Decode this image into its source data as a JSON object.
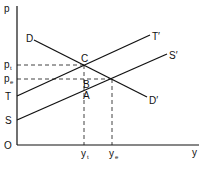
{
  "diagram": {
    "type": "supply-demand-with-tax",
    "axes": {
      "y_label": "p",
      "x_label": "y",
      "origin_label": "O"
    },
    "curves": [
      {
        "name": "demand",
        "start_label": "D",
        "end_label": "D′"
      },
      {
        "name": "supply",
        "start_label": "S",
        "end_label": "S′"
      },
      {
        "name": "tax-shifted-supply",
        "start_label": "T",
        "end_label": "T′"
      }
    ],
    "points": {
      "C": "C",
      "B": "B",
      "A": "A"
    },
    "price_labels": {
      "pt_main": "p",
      "pt_sub": "t",
      "pe_main": "p",
      "pe_sub": "e"
    },
    "quantity_labels": {
      "yt_main": "y",
      "yt_sub": "t",
      "ye_main": "y",
      "ye_sub": "e"
    },
    "colors": {
      "line": "#111111",
      "background": "#ffffff"
    }
  }
}
